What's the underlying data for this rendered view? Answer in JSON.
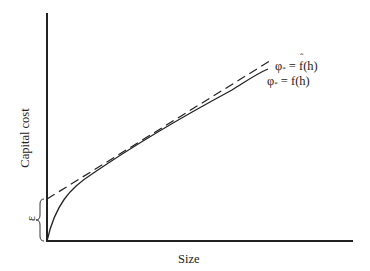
{
  "figure": {
    "type": "economies-of-scale-diagram",
    "axes": {
      "xlabel": "Size",
      "ylabel": "Capital cost"
    },
    "annotations": {
      "intercept_brace_label": "ε"
    },
    "curves": [
      {
        "id": "approx",
        "style": "dashed",
        "label_lhs": "φ",
        "label_sub": "*",
        "label_eq": " = ",
        "label_fn": "f",
        "label_fn_hat": true,
        "label_arg": "(h)"
      },
      {
        "id": "actual",
        "style": "solid",
        "label_lhs": "φ",
        "label_sub": "*",
        "label_eq": " = ",
        "label_fn": "f",
        "label_fn_hat": false,
        "label_arg": "(h)"
      }
    ],
    "colors": {
      "line": "#222222",
      "background": "#ffffff"
    }
  }
}
